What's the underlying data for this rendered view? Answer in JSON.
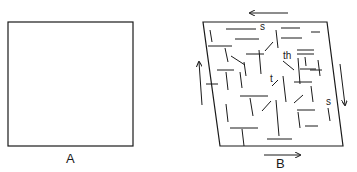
{
  "figure": {
    "panels": [
      {
        "id": "A",
        "label": "A",
        "description": "undeformed square"
      },
      {
        "id": "B",
        "label": "B",
        "description": "sheared parallelogram with fractures"
      }
    ],
    "annotations": [
      {
        "id": "s_top",
        "text": "s"
      },
      {
        "id": "th",
        "text": "th"
      },
      {
        "id": "t",
        "text": "t"
      },
      {
        "id": "s_right",
        "text": "s"
      }
    ],
    "arrows": [
      "top-left",
      "bottom-right",
      "left-up",
      "right-down"
    ],
    "colors": {
      "stroke": "#1a1a1a",
      "background": "#ffffff"
    }
  }
}
